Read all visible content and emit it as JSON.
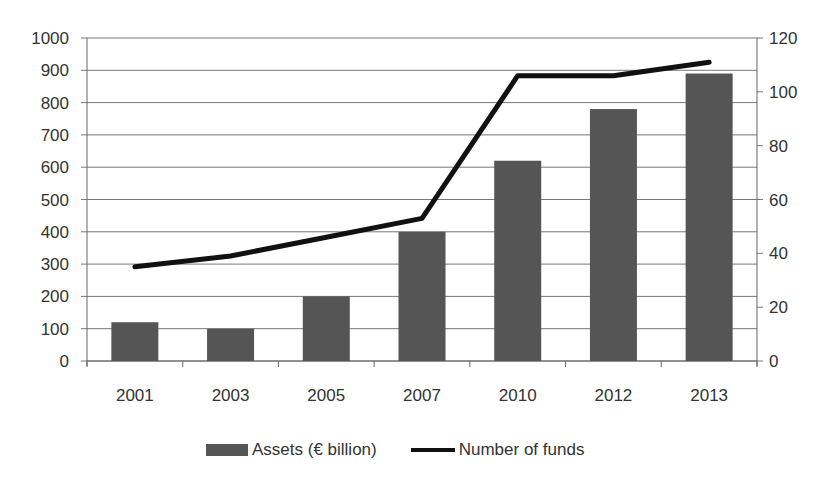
{
  "chart_data": {
    "type": "bar+line",
    "title": "",
    "categories": [
      "2001",
      "2003",
      "2005",
      "2007",
      "2010",
      "2012",
      "2013"
    ],
    "series": [
      {
        "name": "Assets (€ billion)",
        "type": "bar",
        "axis": "left",
        "values": [
          120,
          100,
          200,
          400,
          620,
          780,
          890
        ],
        "color": "#555555"
      },
      {
        "name": "Number of funds",
        "type": "line",
        "axis": "right",
        "values": [
          35,
          39,
          46,
          53,
          106,
          106,
          111
        ],
        "color": "#111111"
      }
    ],
    "left_axis": {
      "min": 0,
      "max": 1000,
      "step": 100,
      "ticks": [
        "0",
        "100",
        "200",
        "300",
        "400",
        "500",
        "600",
        "700",
        "800",
        "900",
        "1000"
      ]
    },
    "right_axis": {
      "min": 0,
      "max": 120,
      "step": 20,
      "ticks": [
        "0",
        "20",
        "40",
        "60",
        "80",
        "100",
        "120"
      ]
    },
    "xlabel": "",
    "ylabel": "",
    "grid": true,
    "legend_position": "bottom"
  },
  "legend": {
    "assets_label": "Assets (€ billion)",
    "funds_label": "Number of funds"
  }
}
